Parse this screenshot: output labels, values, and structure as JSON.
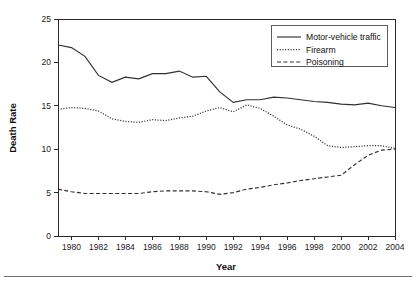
{
  "chart_data": {
    "type": "line",
    "title": "",
    "xlabel": "Year",
    "ylabel": "Death Rate",
    "xlim": [
      1979,
      2004
    ],
    "ylim": [
      0,
      25
    ],
    "grid": false,
    "legend_position": "upper-right",
    "x": [
      1979,
      1980,
      1981,
      1982,
      1983,
      1984,
      1985,
      1986,
      1987,
      1988,
      1989,
      1990,
      1991,
      1992,
      1993,
      1994,
      1995,
      1996,
      1997,
      1998,
      1999,
      2000,
      2001,
      2002,
      2003,
      2004
    ],
    "xticks": [
      1980,
      1982,
      1984,
      1986,
      1988,
      1990,
      1992,
      1994,
      1996,
      1998,
      2000,
      2002,
      2004
    ],
    "xtick_labels": [
      "1980",
      "1982",
      "1984",
      "1986",
      "1988",
      "1990",
      "1992",
      "1994",
      "1996",
      "1998",
      "2000",
      "2002",
      "2004"
    ],
    "yticks": [
      0,
      5,
      10,
      15,
      20,
      25
    ],
    "ytick_labels": [
      "0",
      "5",
      "10",
      "15",
      "20",
      "25"
    ],
    "series": [
      {
        "name": "Motor-vehicle traffic",
        "style": "solid",
        "color": "#303030",
        "values": [
          22.0,
          21.7,
          20.7,
          18.5,
          17.7,
          18.3,
          18.1,
          18.7,
          18.7,
          19.0,
          18.3,
          18.4,
          16.6,
          15.4,
          15.7,
          15.7,
          16.0,
          15.9,
          15.7,
          15.5,
          15.4,
          15.2,
          15.1,
          15.3,
          15.0,
          14.8
        ]
      },
      {
        "name": "Firearm",
        "style": "dotted",
        "color": "#303030",
        "values": [
          14.6,
          14.8,
          14.7,
          14.4,
          13.5,
          13.2,
          13.1,
          13.4,
          13.3,
          13.6,
          13.8,
          14.4,
          14.8,
          14.3,
          15.1,
          14.7,
          13.8,
          12.8,
          12.3,
          11.5,
          10.4,
          10.2,
          10.3,
          10.4,
          10.4,
          10.1
        ]
      },
      {
        "name": "Poisoning",
        "style": "dashed",
        "color": "#303030",
        "values": [
          5.4,
          5.1,
          4.9,
          4.9,
          4.9,
          4.9,
          4.9,
          5.1,
          5.2,
          5.2,
          5.2,
          5.1,
          4.8,
          5.0,
          5.4,
          5.6,
          5.9,
          6.1,
          6.4,
          6.6,
          6.8,
          7.0,
          8.2,
          9.3,
          9.9,
          10.0
        ]
      }
    ]
  },
  "axes": {
    "y_title": "Death Rate",
    "x_title": "Year"
  },
  "legend": {
    "entries": [
      {
        "label": "Motor-vehicle traffic",
        "style": "solid"
      },
      {
        "label": "Firearm",
        "style": "dotted"
      },
      {
        "label": "Poisoning",
        "style": "dashed"
      }
    ]
  }
}
